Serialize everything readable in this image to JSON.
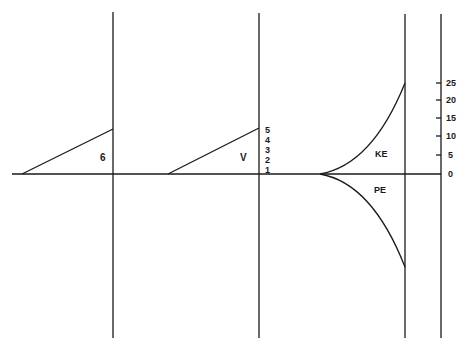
{
  "diagram": {
    "colors": {
      "line": "#1a1a1a",
      "background": "#ffffff"
    },
    "axis": {
      "y": 174,
      "x_start": 12,
      "x_end": 441
    },
    "panels": [
      {
        "name": "panel-1",
        "label": "6",
        "label_pos": [
          103,
          161
        ],
        "vline_x": 113,
        "vline_top": 12,
        "vline_bottom": 338,
        "ramp_from": [
          22,
          174
        ],
        "ramp_to": [
          113,
          129
        ]
      },
      {
        "name": "panel-2",
        "label": "V",
        "label_pos": [
          243,
          161
        ],
        "vline_x": 259,
        "vline_top": 13,
        "vline_bottom": 338,
        "ramp_from": [
          168,
          174
        ],
        "ramp_to": [
          259,
          128
        ]
      },
      {
        "name": "panel-3",
        "vline_x": 405,
        "vline_top": 14,
        "vline_bottom": 338,
        "curve_origin": [
          320,
          174
        ]
      }
    ],
    "v_scale": {
      "labels": [
        "5",
        "4",
        "3",
        "2",
        "1"
      ],
      "x": 266,
      "y": [
        133,
        143,
        153,
        163,
        173
      ]
    },
    "ke": {
      "label": "KE",
      "label_pos": [
        375,
        157
      ],
      "end": [
        405,
        83
      ]
    },
    "pe": {
      "label": "PE",
      "label_pos": [
        374,
        193
      ],
      "end": [
        405,
        267
      ]
    },
    "right_scale": {
      "line_x": 441,
      "ticks": [
        {
          "label": "25",
          "y": 83
        },
        {
          "label": "20",
          "y": 100
        },
        {
          "label": "15",
          "y": 118
        },
        {
          "label": "10",
          "y": 136
        },
        {
          "label": "5",
          "y": 155
        },
        {
          "label": "0",
          "y": 174
        }
      ]
    }
  }
}
